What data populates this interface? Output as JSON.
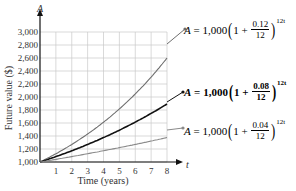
{
  "chart_data": {
    "type": "line",
    "title": "",
    "xlabel": "Time (years)",
    "ylabel": "Future value ($)",
    "x_axis_var": "t",
    "y_axis_var": "A",
    "xlim": [
      0,
      8
    ],
    "ylim": [
      1000,
      3000
    ],
    "x_ticks": [
      1,
      2,
      3,
      4,
      5,
      6,
      7,
      8
    ],
    "y_ticks": [
      1000,
      1200,
      1400,
      1600,
      1800,
      2000,
      2200,
      2400,
      2600,
      2800,
      3000
    ],
    "y_tick_labels": [
      "1,000",
      "1,200",
      "1,400",
      "1,600",
      "1,800",
      "2,000",
      "2,200",
      "2,400",
      "2,600",
      "2,800",
      "3,000"
    ],
    "grid": true,
    "series": [
      {
        "name": "A = 1,000(1 + 0.12/12)^12t",
        "rate": 0.12,
        "color": "#6e6e6e",
        "x": [
          0,
          1,
          2,
          3,
          4,
          5,
          6,
          7,
          8
        ],
        "values": [
          1000,
          1127,
          1270,
          1431,
          1612,
          1817,
          2047,
          2307,
          2600
        ]
      },
      {
        "name": "A = 1,000(1 + 0.08/12)^12t",
        "rate": 0.08,
        "color": "#111111",
        "x": [
          0,
          1,
          2,
          3,
          4,
          5,
          6,
          7,
          8
        ],
        "values": [
          1000,
          1083,
          1173,
          1270,
          1376,
          1490,
          1614,
          1748,
          1893
        ]
      },
      {
        "name": "A = 1,000(1 + 0.04/12)^12t",
        "rate": 0.04,
        "color": "#8a8a8a",
        "x": [
          0,
          1,
          2,
          3,
          4,
          5,
          6,
          7,
          8
        ],
        "values": [
          1000,
          1041,
          1083,
          1127,
          1173,
          1221,
          1271,
          1323,
          1376
        ]
      }
    ]
  },
  "labels": {
    "y_axis_var": "A",
    "x_axis_var": "t",
    "ylabel": "Future value ($)",
    "xlabel": "Time (years)"
  },
  "equations": [
    {
      "lhs": "A",
      "eq": "=",
      "principal": "1,000",
      "one": "1",
      "plus": "+",
      "num": "0.12",
      "den": "12",
      "exp": "12t",
      "color": "#7a7a7a"
    },
    {
      "lhs": "A",
      "eq": "=",
      "principal": "1,000",
      "one": "1",
      "plus": "+",
      "num": "0.08",
      "den": "12",
      "exp": "12t",
      "color": "#111111"
    },
    {
      "lhs": "A",
      "eq": "=",
      "principal": "1,000",
      "one": "1",
      "plus": "+",
      "num": "0.04",
      "den": "12",
      "exp": "12t",
      "color": "#9a9a9a"
    }
  ]
}
